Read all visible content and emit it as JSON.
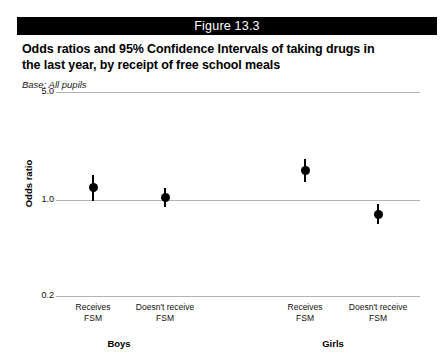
{
  "figure": {
    "bar_label": "Figure 13.3",
    "title_line1": "Odds ratios and 95% Confidence Intervals of taking drugs in",
    "title_line2": "the last year, by receipt of free school meals",
    "base_note": "Base: All pupils",
    "bar_color": "#000000",
    "marker_color": "#000000",
    "gridline_color": "#b3b3b3"
  },
  "chart_data": {
    "type": "scatter",
    "title": "Odds ratios and 95% Confidence Intervals of taking drugs in the last year, by receipt of free school meals",
    "subtitle": "Base: All pupils",
    "xlabel": "",
    "ylabel": "Odds ratio",
    "yscale": "log",
    "ylim": [
      0.2,
      5.0
    ],
    "yticks": [
      0.2,
      1.0,
      5.0
    ],
    "ytick_labels": [
      "0.2",
      "1.0",
      "5.0"
    ],
    "grid": true,
    "legend": "none",
    "reference_line": 1.0,
    "groups": [
      {
        "name": "Boys",
        "label": "Boys"
      },
      {
        "name": "Girls",
        "label": "Girls"
      }
    ],
    "categories": [
      "Receives FSM",
      "Doesn't receive FSM",
      "Receives FSM",
      "Doesn't receive FSM"
    ],
    "points": [
      {
        "group": "Boys",
        "category": "Receives FSM",
        "label_line1": "Receives",
        "label_line2": "FSM",
        "odds_ratio": 1.1,
        "ci_low": 0.9,
        "ci_high": 1.35
      },
      {
        "group": "Boys",
        "category": "Doesn't receive FSM",
        "label_line1": "Doesn't receive",
        "label_line2": "FSM",
        "odds_ratio": 0.95,
        "ci_low": 0.82,
        "ci_high": 1.1
      },
      {
        "group": "Girls",
        "category": "Receives FSM",
        "label_line1": "Receives",
        "label_line2": "FSM",
        "odds_ratio": 1.45,
        "ci_low": 1.2,
        "ci_high": 1.75
      },
      {
        "group": "Girls",
        "category": "Doesn't receive FSM",
        "label_line1": "Doesn't receive",
        "label_line2": "FSM",
        "odds_ratio": 0.72,
        "ci_low": 0.62,
        "ci_high": 0.85
      }
    ]
  },
  "layout": {
    "point_x": [
      93,
      165,
      305,
      378
    ],
    "group_label_x": [
      44,
      258
    ],
    "group_label_y": 338
  }
}
